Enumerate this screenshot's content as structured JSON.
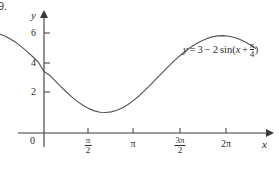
{
  "figure": {
    "problem_number": "9.",
    "width": 279,
    "height": 169,
    "background_color": "#ffffff",
    "curve_color": "#555555",
    "axis_color": "#3a3a3a",
    "text_color": "#2b2b2b"
  },
  "axes": {
    "y_label": "y",
    "x_label": "x",
    "y_ticks": [
      {
        "label": "6",
        "value": 6
      },
      {
        "label": "4",
        "value": 4
      },
      {
        "label": "2",
        "value": 2
      }
    ],
    "x_ticks": [
      {
        "label": "0",
        "value": 0,
        "numerator": "",
        "denominator": ""
      },
      {
        "label": "π/2",
        "value": 1.5708,
        "numerator": "π",
        "denominator": "2"
      },
      {
        "label": "π",
        "value": 3.1416,
        "numerator": "",
        "denominator": ""
      },
      {
        "label": "3π/2",
        "value": 4.7124,
        "numerator": "3π",
        "denominator": "2"
      },
      {
        "label": "2π",
        "value": 6.2832,
        "numerator": "",
        "denominator": ""
      }
    ]
  },
  "equation": {
    "lhs": "y",
    "equals": "=",
    "constant": "3",
    "minus": "−",
    "amplitude": "2",
    "function": "sin(",
    "variable": "x",
    "plus": "+",
    "phase_numerator": "π",
    "phase_denominator": "4",
    "close_paren": ")",
    "full_text": "y = 3 − 2 sin(x + π/4)"
  },
  "chart_data": {
    "type": "line",
    "title": "",
    "xlabel": "x",
    "ylabel": "y",
    "equation": "y = 3 - 2 sin(x + pi/4)",
    "xlim": [
      -1.85,
      7.55
    ],
    "ylim": [
      -0.6,
      7.4
    ],
    "grid": false,
    "legend": "none",
    "amplitude": 2,
    "vertical_shift": 3,
    "phase_shift": 0.7853981634,
    "period": 6.2832,
    "minimum_value": 1,
    "maximum_value": 5,
    "y_intercept": 1.586,
    "x_axis_tick_values": [
      0,
      1.5708,
      3.1416,
      4.7124,
      6.2832
    ],
    "y_axis_tick_values": [
      2,
      4,
      6
    ],
    "x": [
      -1.85,
      -1.6,
      -1.4,
      -1.2,
      -1.0,
      -0.8,
      -0.6,
      -0.4,
      -0.2,
      0.0,
      0.2,
      0.4,
      0.6,
      0.8,
      1.0,
      1.2,
      1.4,
      1.6,
      1.8,
      2.0,
      2.2,
      2.4,
      2.6,
      2.8,
      3.0,
      3.2,
      3.4,
      3.6,
      3.8,
      4.0,
      4.2,
      4.4,
      4.6,
      4.8,
      5.0,
      5.2,
      5.4,
      5.6,
      5.8,
      6.0,
      6.2,
      6.4,
      6.6,
      6.8,
      7.0,
      7.2,
      7.4,
      7.55
    ],
    "y": [
      4.92,
      4.84,
      4.73,
      4.58,
      4.41,
      4.2,
      3.97,
      3.72,
      3.45,
      3.0,
      2.82,
      2.54,
      2.26,
      2.0,
      1.75,
      1.53,
      1.34,
      1.19,
      1.08,
      1.01,
      1.0,
      1.03,
      1.11,
      1.23,
      1.39,
      1.59,
      1.82,
      2.08,
      2.35,
      2.63,
      2.91,
      3.19,
      3.46,
      3.71,
      3.94,
      4.15,
      4.33,
      4.48,
      4.6,
      4.69,
      4.74,
      4.75,
      4.72,
      4.66,
      4.56,
      4.43,
      4.27,
      4.13
    ]
  }
}
